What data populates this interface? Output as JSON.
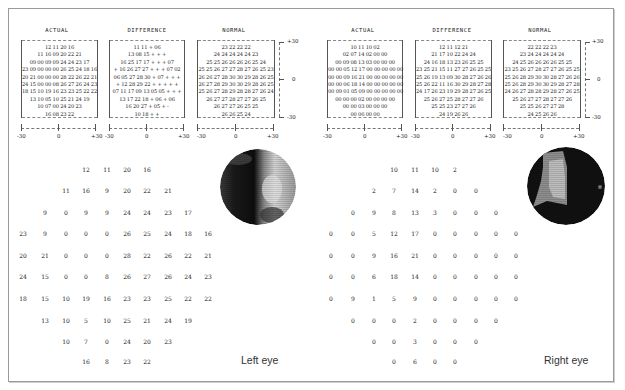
{
  "left_eye": {
    "label": "Left eye",
    "panels": [
      {
        "title": "ACTUAL",
        "rows": [
          "12 11 20 16",
          "11 16 09 20 22 21",
          "09 00 09 09 24 24 23 17",
          "23 09 00 00 00 26 25 24 18 16",
          "20 21 00 00 00 28 22 26 22 21",
          "24 15 00 00 08 26 27 26 24 23",
          "18 15 10 19 16 23 23 25 22 22",
          "13 10 05 10 25 21 24 19",
          "10 07 00 24 20 23",
          "16 08 23 22"
        ]
      },
      {
        "title": "DIFFERENCE",
        "rows": [
          "11 11 + 06",
          "13 08 15 + + +",
          "16 25 17 17 + + + 07",
          "+ 16 26 27 27 + + + 07 02",
          "06 05 27 28 30 + 07 + + +",
          "+ 12 28 29 22 + + + + +",
          "07 11 17 09 13 05 05 + + +",
          "13 17 22 18 + 06 + 06",
          "16 20 27 + 05 + -",
          "10 18 + +"
        ]
      },
      {
        "title": "NORMAL",
        "rows": [
          "23 22 22 22",
          "24 24 24 24 24 23",
          "25 25 26 26 26 26 25 24",
          "25 25 26 27 27 28 27 26 25 23",
          "26 26 27 28 30 30 29 28 26 25",
          "26 27 28 29 30 30 29 28 26 25",
          "25 26 27 28 29 28 28 27 26 24",
          "26 27 27 28 27 27 26 25",
          "26 27 27 26 25 25",
          "26 26 25 24"
        ]
      }
    ],
    "x_axis_labels": [
      "-30",
      "0",
      "+30"
    ],
    "y_axis_labels": [
      "+30",
      "0",
      "-30"
    ],
    "grid": [
      [
        "",
        "",
        "",
        "12",
        "11",
        "20",
        "16",
        "",
        "",
        ""
      ],
      [
        "",
        "",
        "11",
        "16",
        "9",
        "20",
        "22",
        "21",
        "",
        ""
      ],
      [
        "",
        "9",
        "0",
        "9",
        "9",
        "24",
        "24",
        "23",
        "17",
        ""
      ],
      [
        "23",
        "9",
        "0",
        "0",
        "0",
        "26",
        "25",
        "24",
        "18",
        "16"
      ],
      [
        "20",
        "21",
        "0",
        "0",
        "0",
        "28",
        "22",
        "26",
        "22",
        "21"
      ],
      [
        "24",
        "15",
        "0",
        "0",
        "8",
        "26",
        "27",
        "26",
        "24",
        "23"
      ],
      [
        "18",
        "15",
        "10",
        "19",
        "16",
        "23",
        "23",
        "25",
        "22",
        "22"
      ],
      [
        "",
        "13",
        "10",
        "5",
        "10",
        "25",
        "21",
        "24",
        "19",
        ""
      ],
      [
        "",
        "",
        "10",
        "7",
        "0",
        "24",
        "20",
        "23",
        "",
        ""
      ],
      [
        "",
        "",
        "",
        "16",
        "8",
        "23",
        "22",
        "",
        "",
        ""
      ]
    ]
  },
  "right_eye": {
    "label": "Right eye",
    "panels": [
      {
        "title": "ACTUAL",
        "rows": [
          "10 11 10 02",
          "02 07 14 02 00 00",
          "00 09 08 13 03 00 00 00",
          "00 00 05 12 17 00 00 00 00 00",
          "00 00 09 16 21 00 00 00 00 00",
          "00 00 06 18 14 00 00 00 00 00",
          "00 09 01 05 09 00 00 00 00 00",
          "00 00 00 02 00 00 00 00",
          "00 00 03 00 00 00",
          "00 06 00 00"
        ]
      },
      {
        "title": "DIFFERENCE",
        "rows": [
          "12 11 12 21",
          "21 17 10 22 24 24",
          "24 16 18 13 23 26 25 25",
          "23 25 21 15 11 27 27 26 25 25",
          "25 26 19 13 09 30 28 27 26 26",
          "25 26 22 11 16 30 29 28 27 28",
          "24 17 26 23 19 29 28 27 26 25",
          "25 26 27 25 28 27 27 26",
          "25 25 23 27 27 26",
          "24 19 26 26"
        ]
      },
      {
        "title": "NORMAL",
        "rows": [
          "22 22 22 23",
          "23 24 24 24 24 24",
          "24 25 26 26 26 26 25 25",
          "23 25 26 27 28 27 27 26 25 25",
          "25 26 28 29 30 30 28 27 26 26",
          "25 26 28 29 30 30 29 28 27 28",
          "24 26 27 28 28 29 28 27 26 25",
          "25 26 27 27 28 27 27 26",
          "25 25 26 27 27 28",
          "24 25 26 26"
        ]
      }
    ],
    "x_axis_labels": [
      "-30",
      "0",
      "+30"
    ],
    "y_axis_labels": [
      "+30",
      "0",
      "-30"
    ],
    "grid": [
      [
        "",
        "",
        "",
        "10",
        "11",
        "10",
        "2",
        "",
        "",
        ""
      ],
      [
        "",
        "",
        "2",
        "7",
        "14",
        "2",
        "0",
        "0",
        "",
        ""
      ],
      [
        "",
        "0",
        "9",
        "8",
        "13",
        "3",
        "0",
        "0",
        "0",
        ""
      ],
      [
        "0",
        "0",
        "5",
        "12",
        "17",
        "0",
        "0",
        "0",
        "0",
        "0"
      ],
      [
        "0",
        "0",
        "9",
        "16",
        "21",
        "0",
        "0",
        "0",
        "0",
        "0"
      ],
      [
        "0",
        "0",
        "6",
        "18",
        "14",
        "0",
        "0",
        "0",
        "0",
        "0"
      ],
      [
        "0",
        "9",
        "1",
        "5",
        "9",
        "0",
        "0",
        "0",
        "0",
        "0"
      ],
      [
        "",
        "0",
        "0",
        "0",
        "2",
        "0",
        "0",
        "0",
        "0",
        ""
      ],
      [
        "",
        "",
        "0",
        "0",
        "3",
        "0",
        "0",
        "0",
        "",
        ""
      ],
      [
        "",
        "",
        "",
        "0",
        "6",
        "0",
        "0",
        "",
        "",
        ""
      ]
    ]
  },
  "colors": {
    "frame": "#9a9a9a",
    "text": "#222222",
    "scotoma": "#111111",
    "seeing": "#d8d8d8"
  }
}
